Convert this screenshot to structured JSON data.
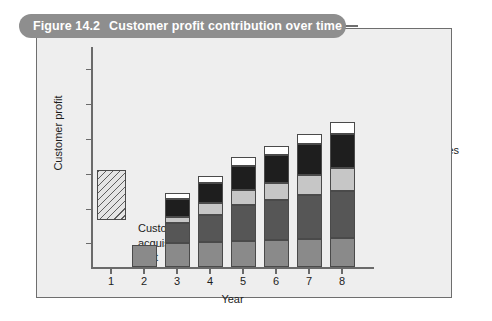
{
  "figure": {
    "number": "Figure 14.2",
    "title": "Customer profit contribution over time"
  },
  "chart_data": {
    "type": "bar",
    "subtype": "stacked",
    "title": "Customer profit contribution over time",
    "xlabel": "Year",
    "ylabel": "Customer profit",
    "categories": [
      "1",
      "2",
      "3",
      "4",
      "5",
      "6",
      "7",
      "8"
    ],
    "grid": false,
    "legend_position": "right",
    "ylim": [
      -1.2,
      8.2
    ],
    "axis_tick_labels_y": [],
    "series": [
      {
        "name": "Base profit",
        "color": "#8a8a8a",
        "values": [
          0,
          1.05,
          1.15,
          1.2,
          1.25,
          1.3,
          1.35,
          1.4
        ]
      },
      {
        "name": "Increased purchases",
        "color": "#565656",
        "values": [
          0,
          0,
          1.0,
          1.35,
          1.75,
          1.95,
          2.15,
          2.3
        ]
      },
      {
        "name": "Reduced operating costs",
        "color": "#c6c6c6",
        "values": [
          0,
          0,
          0.3,
          0.55,
          0.75,
          0.85,
          1.0,
          1.15
        ]
      },
      {
        "name": "Referrals",
        "color": "#1e1e1e",
        "values": [
          0,
          0,
          0.85,
          1.0,
          1.2,
          1.35,
          1.5,
          1.65
        ]
      },
      {
        "name": "Price premium",
        "color": "#ffffff",
        "values": [
          0,
          0,
          0.3,
          0.35,
          0.4,
          0.45,
          0.5,
          0.55
        ]
      }
    ],
    "negative_bar": {
      "category": "1",
      "name": "Customer acquisition cost",
      "value": -1.0,
      "fill": "hatched"
    },
    "annotations": [
      {
        "text_lines": [
          "Customer",
          "acquisition",
          "cost"
        ],
        "near": "bar-1"
      }
    ]
  },
  "legend": {
    "items": [
      {
        "label": "Price premium"
      },
      {
        "label": "Referrals"
      },
      {
        "label": "Reduced operating"
      },
      {
        "label": "costs"
      },
      {
        "label": "Increased purchases"
      },
      {
        "label": "Base profit"
      }
    ]
  },
  "axes": {
    "x_tick_labels": [
      "1",
      "2",
      "3",
      "4",
      "5",
      "6",
      "7",
      "8"
    ],
    "x_title": "Year",
    "y_title": "Customer profit"
  },
  "annotation": {
    "line1": "Customer",
    "line2": "acquisition",
    "line3": "cost"
  }
}
